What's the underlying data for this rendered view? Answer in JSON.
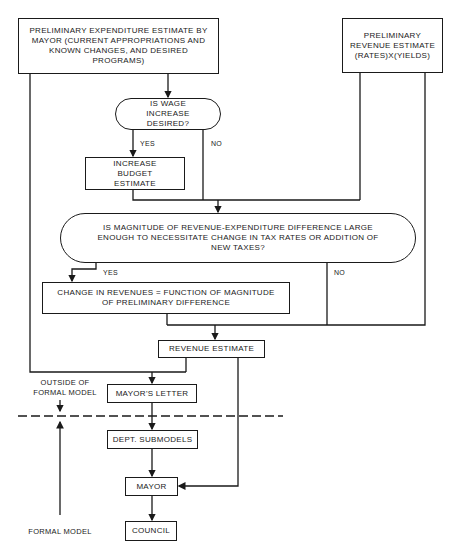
{
  "diagram": {
    "type": "flowchart",
    "nodes": {
      "expenditure_estimate": "PRELIMINARY EXPENDITURE ESTIMATE BY MAYOR (CURRENT APPROPRIATIONS AND KNOWN CHANGES, AND DESIRED PROGRAMS)",
      "revenue_estimate_prelim": "PRELIMINARY REVENUE ESTIMATE (RATES)X(YIELDS)",
      "wage_decision": "IS WAGE INCREASE DESIRED?",
      "increase_budget": "INCREASE BUDGET ESTIMATE",
      "magnitude_decision": "IS MAGNITUDE OF REVENUE-EXPENDITURE DIFFERENCE LARGE ENOUGH TO NECESSITATE CHANGE IN TAX RATES OR ADDITION OF NEW TAXES?",
      "change_in_revenues": "CHANGE IN REVENUES = FUNCTION OF MAGNITUDE OF PRELIMINARY DIFFERENCE",
      "revenue_estimate": "REVENUE ESTIMATE",
      "mayors_letter": "MAYOR'S LETTER",
      "dept_submodels": "DEPT. SUBMODELS",
      "mayor": "MAYOR",
      "council": "COUNCIL"
    },
    "edge_labels": {
      "wage_yes": "YES",
      "wage_no": "NO",
      "magnitude_yes": "YES",
      "magnitude_no": "NO"
    },
    "regions": {
      "outside": "OUTSIDE OF FORMAL MODEL",
      "formal": "FORMAL MODEL"
    },
    "edges": [
      [
        "expenditure_estimate",
        "wage_decision"
      ],
      [
        "wage_decision",
        "increase_budget",
        "YES"
      ],
      [
        "wage_decision",
        "magnitude_decision",
        "NO"
      ],
      [
        "increase_budget",
        "magnitude_decision"
      ],
      [
        "revenue_estimate_prelim",
        "magnitude_decision"
      ],
      [
        "magnitude_decision",
        "change_in_revenues",
        "YES"
      ],
      [
        "magnitude_decision",
        "revenue_estimate",
        "NO"
      ],
      [
        "change_in_revenues",
        "revenue_estimate"
      ],
      [
        "revenue_estimate_prelim",
        "revenue_estimate"
      ],
      [
        "expenditure_estimate",
        "mayors_letter"
      ],
      [
        "revenue_estimate",
        "mayors_letter"
      ],
      [
        "mayors_letter",
        "dept_submodels"
      ],
      [
        "dept_submodels",
        "mayor"
      ],
      [
        "revenue_estimate",
        "mayor"
      ],
      [
        "mayor",
        "council"
      ]
    ]
  }
}
